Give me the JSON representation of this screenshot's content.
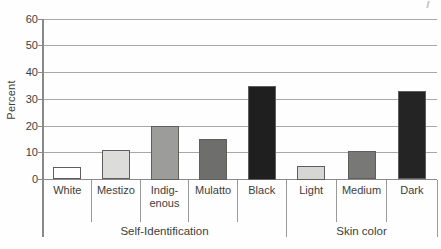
{
  "colors": {
    "grid": "#a8a8a6",
    "axis": "#8a8a88",
    "text": "#3d3d3d",
    "bar_border": "#5e5e5c",
    "background": "#fefefe"
  },
  "chart_data": {
    "type": "bar",
    "title": "",
    "xlabel": "",
    "ylabel": "Percent",
    "ylim": [
      0,
      60
    ],
    "yticks": [
      0,
      10,
      20,
      30,
      40,
      50,
      60
    ],
    "grid": true,
    "legend": false,
    "groups": [
      {
        "label": "Self-Identification",
        "categories": [
          "White",
          "Mestizo",
          "Indig-\nenous",
          "Mulatto",
          "Black"
        ],
        "values": [
          4.5,
          11,
          20,
          15,
          35
        ],
        "bar_colors": [
          "#ffffff",
          "#dcdcda",
          "#9c9c9a",
          "#6e6e6c",
          "#1f1f1f"
        ]
      },
      {
        "label": "Skin color",
        "categories": [
          "Light",
          "Medium",
          "Dark"
        ],
        "values": [
          5,
          10.5,
          33
        ],
        "bar_colors": [
          "#d6d6d4",
          "#787876",
          "#242424"
        ]
      }
    ]
  }
}
